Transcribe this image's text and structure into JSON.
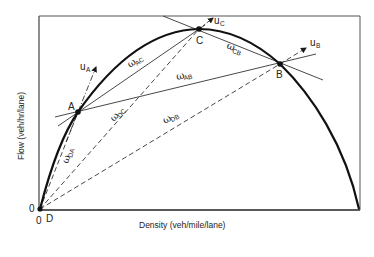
{
  "diagram": {
    "type": "flow-density fundamental diagram (shockwave construction)",
    "axes": {
      "y_label": "Flow (veh/hr/lane)",
      "x_label": "Density (veh/mile/lane)",
      "origin_y_label": "0",
      "origin_x_label": "0"
    },
    "points": {
      "D": "D",
      "A": "A",
      "B": "B",
      "C": "C"
    },
    "speed_labels": {
      "uA": {
        "main": "u",
        "sub": "A"
      },
      "uB": {
        "main": "u",
        "sub": "B"
      },
      "uC": {
        "main": "u",
        "sub": "C"
      }
    },
    "wave_labels": {
      "wAC": {
        "main": "ω",
        "sub": "AC"
      },
      "wAB": {
        "main": "ω",
        "sub": "AB"
      },
      "wCB": {
        "main": "ω",
        "sub": "CB"
      },
      "wDC": {
        "main": "ω",
        "sub": "DC"
      },
      "wDB": {
        "main": "ω",
        "sub": "DB"
      },
      "wDA": {
        "main": "ω",
        "sub": "DA"
      }
    },
    "colors": {
      "ink": "#1a1a1a",
      "background": "#ffffff"
    }
  }
}
